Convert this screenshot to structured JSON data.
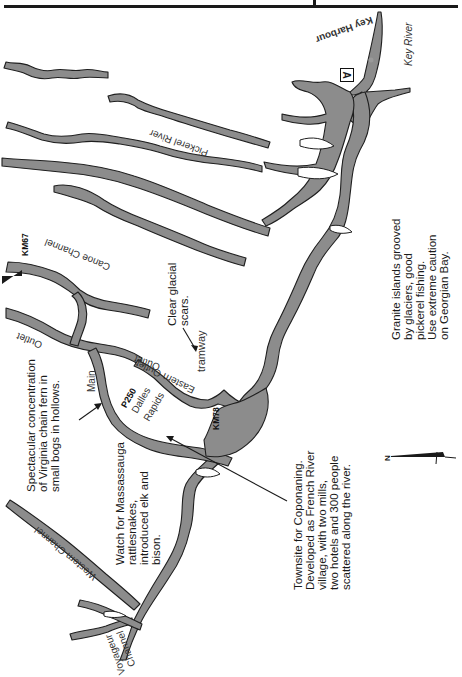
{
  "colors": {
    "water": "#8c8c8c",
    "water_outline": "#1f1f1f",
    "land": "#ffffff",
    "text": "#1a1a1a"
  },
  "map": {
    "orientation": "rotated 90° clockwise (north arrow points left)",
    "place_labels": {
      "key_harbour": "Key Harbour",
      "key_river": "Key River",
      "pickerel_river": "Pickerel River",
      "canoe_channel": "Canoe Channel",
      "outlet": "Outlet",
      "main_outlet_main": "Main",
      "main_outlet_outlet": "Outlet",
      "eastern_outlet": "Eastern Outlet",
      "dalles_rapids_line1": "Dalles",
      "dalles_rapids_line2": "Rapids",
      "tramway": "tramway",
      "western_channel": "Western Channel",
      "voyageur_channel_line1": "Voyageur",
      "voyageur_channel_line2": "Channel"
    },
    "markers": {
      "km67": "KM67",
      "km78": "KM78",
      "p250": "P250",
      "campsite_symbol": "A",
      "north_label": "N"
    },
    "notes": {
      "glacial_scars": [
        "Clear glacial",
        "scars."
      ],
      "virginia_fern": [
        "Spectacular concentration",
        "of Virginia chain fern in",
        "small bogs in hollows."
      ],
      "massassauga": [
        "Watch for Massassauga",
        "rattlesnakes,",
        "introduced elk and",
        "bison."
      ],
      "coponaning": [
        "Townsite for Coponaning.",
        "Developed as French River",
        "village, with two mills,",
        "two hotels and 300 people",
        "scattered along the river."
      ],
      "granite": [
        "Granite islands grooved",
        "by glaciers, good",
        "pickerel fishing.",
        "Use extreme caution",
        "on Georgian Bay."
      ]
    }
  }
}
